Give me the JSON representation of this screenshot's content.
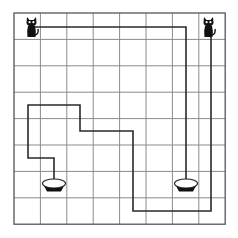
{
  "puzzle": {
    "type": "maze-path-matching",
    "grid": {
      "cols": 8,
      "rows": 8,
      "x0": 14,
      "y0": 13,
      "cell": 26.4,
      "line_color": "#8a8a8a",
      "border_color": "#555555"
    },
    "path_color": "#2a2a2a",
    "cats": [
      {
        "id": "cat-left",
        "x": 26,
        "y": 16,
        "icon": "cat-icon"
      },
      {
        "id": "cat-right",
        "x": 203,
        "y": 16,
        "icon": "cat-icon"
      }
    ],
    "bowls": [
      {
        "id": "bowl-left",
        "x": 54,
        "y": 185,
        "icon": "bowl-icon"
      },
      {
        "id": "bowl-right",
        "x": 186,
        "y": 185,
        "icon": "bowl-icon"
      }
    ],
    "paths": [
      {
        "id": "path-left-cat",
        "points": "35,27 186,27 186,179"
      },
      {
        "id": "path-right-cat",
        "points": "211,37 211,211 133,211 133,131 80,131 80,105 28,105 28,158 54,158 54,179"
      }
    ]
  }
}
